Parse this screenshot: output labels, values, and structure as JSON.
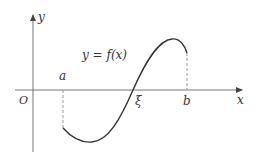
{
  "diagram": {
    "type": "function-graph",
    "labels": {
      "y_axis": "y",
      "x_axis": "x",
      "origin": "O",
      "function": "y = f(x)",
      "a": "a",
      "b": "b",
      "xi": "ξ"
    },
    "colors": {
      "axis": "#666666",
      "curve": "#333333",
      "dashed": "#999999",
      "text": "#333333"
    }
  }
}
